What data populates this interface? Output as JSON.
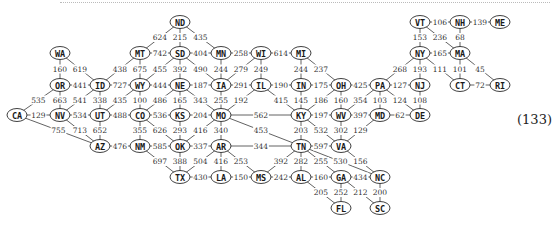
{
  "equation_number": "(133)",
  "nodes": [
    {
      "id": "ND",
      "x": 180,
      "y": 22
    },
    {
      "id": "VT",
      "x": 420,
      "y": 22
    },
    {
      "id": "NH",
      "x": 460,
      "y": 22
    },
    {
      "id": "ME",
      "x": 500,
      "y": 22
    },
    {
      "id": "WA",
      "x": 60,
      "y": 53
    },
    {
      "id": "MT",
      "x": 140,
      "y": 53
    },
    {
      "id": "SD",
      "x": 180,
      "y": 53
    },
    {
      "id": "MN",
      "x": 221,
      "y": 53
    },
    {
      "id": "WI",
      "x": 261,
      "y": 53
    },
    {
      "id": "MI",
      "x": 301,
      "y": 53
    },
    {
      "id": "NY",
      "x": 420,
      "y": 53
    },
    {
      "id": "MA",
      "x": 460,
      "y": 53
    },
    {
      "id": "OR",
      "x": 60,
      "y": 85
    },
    {
      "id": "ID",
      "x": 100,
      "y": 85
    },
    {
      "id": "WY",
      "x": 140,
      "y": 85
    },
    {
      "id": "NE",
      "x": 180,
      "y": 85
    },
    {
      "id": "IA",
      "x": 221,
      "y": 85
    },
    {
      "id": "IL",
      "x": 261,
      "y": 85
    },
    {
      "id": "IN",
      "x": 301,
      "y": 85
    },
    {
      "id": "OH",
      "x": 341,
      "y": 85
    },
    {
      "id": "PA",
      "x": 380,
      "y": 85
    },
    {
      "id": "NJ",
      "x": 420,
      "y": 85
    },
    {
      "id": "CT",
      "x": 460,
      "y": 85
    },
    {
      "id": "RI",
      "x": 500,
      "y": 85
    },
    {
      "id": "CA",
      "x": 17,
      "y": 115
    },
    {
      "id": "NV",
      "x": 60,
      "y": 115
    },
    {
      "id": "UT",
      "x": 100,
      "y": 115
    },
    {
      "id": "CO",
      "x": 140,
      "y": 115
    },
    {
      "id": "KS",
      "x": 180,
      "y": 115
    },
    {
      "id": "MO",
      "x": 221,
      "y": 115
    },
    {
      "id": "KY",
      "x": 301,
      "y": 115
    },
    {
      "id": "WV",
      "x": 341,
      "y": 115
    },
    {
      "id": "MD",
      "x": 380,
      "y": 115
    },
    {
      "id": "DE",
      "x": 420,
      "y": 115
    },
    {
      "id": "AZ",
      "x": 100,
      "y": 146
    },
    {
      "id": "NM",
      "x": 140,
      "y": 146
    },
    {
      "id": "OK",
      "x": 180,
      "y": 146
    },
    {
      "id": "AR",
      "x": 221,
      "y": 146
    },
    {
      "id": "TN",
      "x": 301,
      "y": 146
    },
    {
      "id": "VA",
      "x": 341,
      "y": 146
    },
    {
      "id": "TX",
      "x": 180,
      "y": 177
    },
    {
      "id": "LA",
      "x": 221,
      "y": 177
    },
    {
      "id": "MS",
      "x": 261,
      "y": 177
    },
    {
      "id": "AL",
      "x": 301,
      "y": 177
    },
    {
      "id": "GA",
      "x": 341,
      "y": 177
    },
    {
      "id": "NC",
      "x": 380,
      "y": 177
    },
    {
      "id": "FL",
      "x": 341,
      "y": 208
    },
    {
      "id": "SC",
      "x": 380,
      "y": 208
    }
  ],
  "edges": [
    {
      "a": "ND",
      "b": "MT",
      "w": 624
    },
    {
      "a": "ND",
      "b": "SD",
      "w": 215
    },
    {
      "a": "ND",
      "b": "MN",
      "w": 435
    },
    {
      "a": "VT",
      "b": "NH",
      "w": 106
    },
    {
      "a": "NH",
      "b": "ME",
      "w": 139
    },
    {
      "a": "VT",
      "b": "NY",
      "w": 153
    },
    {
      "a": "VT",
      "b": "MA",
      "w": 236
    },
    {
      "a": "NH",
      "b": "MA",
      "w": 68
    },
    {
      "a": "WA",
      "b": "OR",
      "w": 160
    },
    {
      "a": "WA",
      "b": "ID",
      "w": 619
    },
    {
      "a": "MT",
      "b": "SD",
      "w": 742
    },
    {
      "a": "SD",
      "b": "MN",
      "w": 404
    },
    {
      "a": "MN",
      "b": "WI",
      "w": 258
    },
    {
      "a": "WI",
      "b": "MI",
      "w": 614
    },
    {
      "a": "NY",
      "b": "MA",
      "w": 165
    },
    {
      "a": "MT",
      "b": "ID",
      "w": 438
    },
    {
      "a": "MT",
      "b": "WY",
      "w": 675
    },
    {
      "a": "SD",
      "b": "WY",
      "w": 455
    },
    {
      "a": "SD",
      "b": "NE",
      "w": 392
    },
    {
      "a": "SD",
      "b": "IA",
      "w": 490
    },
    {
      "a": "MN",
      "b": "IA",
      "w": 244
    },
    {
      "a": "WI",
      "b": "IA",
      "w": 279
    },
    {
      "a": "WI",
      "b": "IL",
      "w": 249
    },
    {
      "a": "MI",
      "b": "IN",
      "w": 244
    },
    {
      "a": "MI",
      "b": "OH",
      "w": 237
    },
    {
      "a": "NY",
      "b": "PA",
      "w": 268
    },
    {
      "a": "NY",
      "b": "NJ",
      "w": 193
    },
    {
      "a": "NY",
      "b": "CT",
      "w": 111
    },
    {
      "a": "MA",
      "b": "CT",
      "w": 101
    },
    {
      "a": "MA",
      "b": "RI",
      "w": 45
    },
    {
      "a": "OR",
      "b": "ID",
      "w": 441
    },
    {
      "a": "ID",
      "b": "WY",
      "w": 727
    },
    {
      "a": "WY",
      "b": "NE",
      "w": 444
    },
    {
      "a": "NE",
      "b": "IA",
      "w": 187
    },
    {
      "a": "IA",
      "b": "IL",
      "w": 291
    },
    {
      "a": "IL",
      "b": "IN",
      "w": 190
    },
    {
      "a": "IN",
      "b": "OH",
      "w": 175
    },
    {
      "a": "OH",
      "b": "PA",
      "w": 425
    },
    {
      "a": "PA",
      "b": "NJ",
      "w": 127
    },
    {
      "a": "CT",
      "b": "RI",
      "w": 72
    },
    {
      "a": "OR",
      "b": "CA",
      "w": 535
    },
    {
      "a": "OR",
      "b": "NV",
      "w": 663
    },
    {
      "a": "ID",
      "b": "NV",
      "w": 541
    },
    {
      "a": "ID",
      "b": "UT",
      "w": 338
    },
    {
      "a": "WY",
      "b": "UT",
      "w": 435
    },
    {
      "a": "WY",
      "b": "CO",
      "w": 100
    },
    {
      "a": "NE",
      "b": "CO",
      "w": 486
    },
    {
      "a": "NE",
      "b": "KS",
      "w": 165
    },
    {
      "a": "NE",
      "b": "MO",
      "w": 343
    },
    {
      "a": "IA",
      "b": "MO",
      "w": 255
    },
    {
      "a": "IL",
      "b": "MO",
      "w": 192
    },
    {
      "a": "IL",
      "b": "KY",
      "w": 415
    },
    {
      "a": "IN",
      "b": "KY",
      "w": 145
    },
    {
      "a": "OH",
      "b": "KY",
      "w": 186
    },
    {
      "a": "OH",
      "b": "WV",
      "w": 160
    },
    {
      "a": "PA",
      "b": "WV",
      "w": 354
    },
    {
      "a": "PA",
      "b": "MD",
      "w": 103
    },
    {
      "a": "PA",
      "b": "DE",
      "w": 124
    },
    {
      "a": "NJ",
      "b": "DE",
      "w": 108
    },
    {
      "a": "CA",
      "b": "NV",
      "w": 129
    },
    {
      "a": "NV",
      "b": "UT",
      "w": 534
    },
    {
      "a": "UT",
      "b": "CO",
      "w": 488
    },
    {
      "a": "CO",
      "b": "KS",
      "w": 536
    },
    {
      "a": "KS",
      "b": "MO",
      "w": 204
    },
    {
      "a": "MO",
      "b": "KY",
      "w": 562
    },
    {
      "a": "KY",
      "b": "WV",
      "w": 197
    },
    {
      "a": "WV",
      "b": "MD",
      "w": 397
    },
    {
      "a": "MD",
      "b": "DE",
      "w": 62
    },
    {
      "a": "CA",
      "b": "AZ",
      "w": 755
    },
    {
      "a": "NV",
      "b": "AZ",
      "w": 713
    },
    {
      "a": "UT",
      "b": "AZ",
      "w": 652
    },
    {
      "a": "CO",
      "b": "NM",
      "w": 355
    },
    {
      "a": "CO",
      "b": "OK",
      "w": 626
    },
    {
      "a": "KS",
      "b": "OK",
      "w": 293
    },
    {
      "a": "MO",
      "b": "OK",
      "w": 416
    },
    {
      "a": "MO",
      "b": "AR",
      "w": 340
    },
    {
      "a": "MO",
      "b": "TN",
      "w": 453
    },
    {
      "a": "KY",
      "b": "TN",
      "w": 203
    },
    {
      "a": "KY",
      "b": "VA",
      "w": 532
    },
    {
      "a": "WV",
      "b": "VA",
      "w": 302
    },
    {
      "a": "MD",
      "b": "VA",
      "w": 129
    },
    {
      "a": "AZ",
      "b": "NM",
      "w": 476
    },
    {
      "a": "NM",
      "b": "OK",
      "w": 585
    },
    {
      "a": "OK",
      "b": "AR",
      "w": 337
    },
    {
      "a": "AR",
      "b": "TN",
      "w": 344
    },
    {
      "a": "TN",
      "b": "VA",
      "w": 597
    },
    {
      "a": "NM",
      "b": "TX",
      "w": 697
    },
    {
      "a": "OK",
      "b": "TX",
      "w": 388
    },
    {
      "a": "AR",
      "b": "TX",
      "w": 504
    },
    {
      "a": "AR",
      "b": "LA",
      "w": 416
    },
    {
      "a": "AR",
      "b": "MS",
      "w": 253
    },
    {
      "a": "TN",
      "b": "MS",
      "w": 392
    },
    {
      "a": "TN",
      "b": "AL",
      "w": 282
    },
    {
      "a": "TN",
      "b": "GA",
      "w": 255
    },
    {
      "a": "TN",
      "b": "NC",
      "w": 530
    },
    {
      "a": "VA",
      "b": "NC",
      "w": 156
    },
    {
      "a": "TX",
      "b": "LA",
      "w": 430
    },
    {
      "a": "LA",
      "b": "MS",
      "w": 150
    },
    {
      "a": "MS",
      "b": "AL",
      "w": 242
    },
    {
      "a": "AL",
      "b": "GA",
      "w": 160
    },
    {
      "a": "GA",
      "b": "NC",
      "w": 434
    },
    {
      "a": "AL",
      "b": "FL",
      "w": 205
    },
    {
      "a": "GA",
      "b": "FL",
      "w": 252
    },
    {
      "a": "GA",
      "b": "SC",
      "w": 212
    },
    {
      "a": "NC",
      "b": "SC",
      "w": 200
    }
  ]
}
